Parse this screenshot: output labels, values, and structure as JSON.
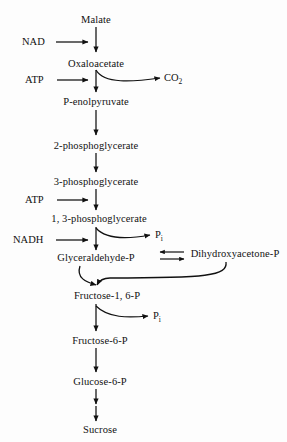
{
  "diagram": {
    "background_color": "#fdfdfd",
    "stroke_color": "#111111",
    "text_color": "#111111",
    "main_column_x": 96,
    "nodes": [
      {
        "id": "malate",
        "label": "Malate",
        "x": 96,
        "y": 16
      },
      {
        "id": "oxaloacetate",
        "label": "Oxaloacetate",
        "x": 96,
        "y": 63
      },
      {
        "id": "pep",
        "label": "P-enolpyruvate",
        "x": 96,
        "y": 101
      },
      {
        "id": "pg2",
        "label": "2-phosphoglycerate",
        "x": 96,
        "y": 145
      },
      {
        "id": "pg3",
        "label": "3-phosphoglycerate",
        "x": 96,
        "y": 181
      },
      {
        "id": "pg13",
        "label": "1, 3-phosphoglycerate",
        "x": 96,
        "y": 219
      },
      {
        "id": "gap",
        "label": "Glyceraldehyde-P",
        "x": 96,
        "y": 259
      },
      {
        "id": "dhap",
        "label": "Dihydroxyacetone-P",
        "x": 235,
        "y": 255
      },
      {
        "id": "fbp",
        "label": "Fructose-1, 6-P",
        "x": 107,
        "y": 297
      },
      {
        "id": "f6p",
        "label": "Fructose-6-P",
        "x": 100,
        "y": 341
      },
      {
        "id": "g6p",
        "label": "Glucose-6-P",
        "x": 100,
        "y": 382
      },
      {
        "id": "sucrose",
        "label": "Sucrose",
        "x": 100,
        "y": 430
      }
    ],
    "cofactors": [
      {
        "id": "nad",
        "label": "NAD",
        "x": 22,
        "y": 42,
        "arrow_from_x": 57,
        "arrow_to_x": 92,
        "arrow_y": 42
      },
      {
        "id": "atp1",
        "label": "ATP",
        "x": 25,
        "y": 80,
        "arrow_from_x": 58,
        "arrow_to_x": 92,
        "arrow_y": 80
      },
      {
        "id": "atp2",
        "label": "ATP",
        "x": 25,
        "y": 200,
        "arrow_from_x": 58,
        "arrow_to_x": 92,
        "arrow_y": 200
      },
      {
        "id": "nadh",
        "label": "NADH",
        "x": 14,
        "y": 240,
        "arrow_from_x": 57,
        "arrow_to_x": 92,
        "arrow_y": 240
      }
    ],
    "byproducts": [
      {
        "id": "co2",
        "label": "CO",
        "subscript": "2",
        "x": 167,
        "y": 78
      },
      {
        "id": "pi1",
        "label": "P",
        "subscript": "i",
        "x": 158,
        "y": 235
      },
      {
        "id": "pi2",
        "label": "P",
        "subscript": "i",
        "x": 156,
        "y": 316
      }
    ],
    "reversible_pair": {
      "left_node": "gap",
      "right_node": "dhap",
      "label": "interconversion"
    },
    "steps": [
      "Malate to Oxaloacetate (NAD)",
      "Oxaloacetate to P-enolpyruvate (ATP, releasing CO2)",
      "P-enolpyruvate to 2-phosphoglycerate",
      "2-phosphoglycerate to 3-phosphoglycerate",
      "3-phosphoglycerate to 1, 3-phosphoglycerate (ATP)",
      "1, 3-phosphoglycerate to Glyceraldehyde-P (NADH, releasing Pi)",
      "Glyceraldehyde-P reversible with Dihydroxyacetone-P",
      "Glyceraldehyde-P + Dihydroxyacetone-P to Fructose-1, 6-P",
      "Fructose-1, 6-P to Fructose-6-P (releasing Pi)",
      "Fructose-6-P to Glucose-6-P",
      "Glucose-6-P to Sucrose"
    ]
  }
}
